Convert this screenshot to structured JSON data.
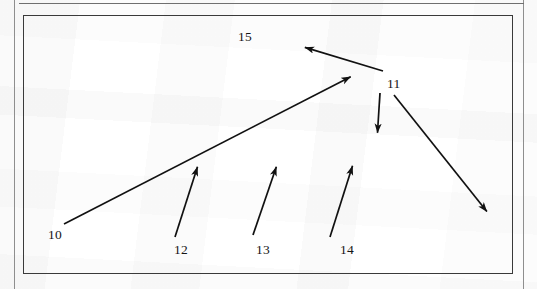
{
  "document": {
    "type": "patent-figure",
    "page_frame": {
      "left_rule_color": "#8e8e8e",
      "right_rule_color": "#8e8e8e",
      "top_rule_color": "#6f6f6f"
    },
    "figure_box": {
      "border_color": "#3a3a3a",
      "background": "#fafafa"
    }
  },
  "figure": {
    "line_color": "#111111",
    "reference_numerals": [
      {
        "id": "10",
        "label": "10",
        "x": 48,
        "y": 228
      },
      {
        "id": "15",
        "label": "15",
        "x": 238,
        "y": 30
      },
      {
        "id": "11",
        "label": "11",
        "x": 387,
        "y": 77
      },
      {
        "id": "12",
        "label": "12",
        "x": 174,
        "y": 243
      },
      {
        "id": "13",
        "label": "13",
        "x": 256,
        "y": 243
      },
      {
        "id": "14",
        "label": "14",
        "x": 340,
        "y": 243
      }
    ],
    "leader_arrows": [
      {
        "id": "arrow-10",
        "for_numeral": "10",
        "from": [
          64,
          224
        ],
        "to": [
          358,
          73
        ],
        "description": "long diagonal leader rising to upper-right vertex"
      },
      {
        "id": "arrow-15",
        "for_numeral": "15",
        "from": [
          383,
          71
        ],
        "to": [
          297,
          45
        ],
        "description": "leader from vertex pointing up-left toward numeral 15"
      },
      {
        "id": "arrow-11-down",
        "for_numeral": "11",
        "from": [
          380,
          93
        ],
        "to": [
          377,
          141
        ],
        "description": "near-vertical leader descending from numeral 11"
      },
      {
        "id": "arrow-11-downright",
        "for_numeral": "11",
        "from": [
          394,
          95
        ],
        "to": [
          492,
          218
        ],
        "description": "leader descending to the right from numeral 11"
      },
      {
        "id": "arrow-12",
        "for_numeral": "12",
        "from": [
          175,
          237
        ],
        "to": [
          200,
          159
        ],
        "description": "short leader rising to upper-right"
      },
      {
        "id": "arrow-13",
        "for_numeral": "13",
        "from": [
          253,
          235
        ],
        "to": [
          279,
          159
        ],
        "description": "short leader rising to upper-right"
      },
      {
        "id": "arrow-14",
        "for_numeral": "14",
        "from": [
          330,
          237
        ],
        "to": [
          355,
          158
        ],
        "description": "short leader rising to upper-right"
      }
    ]
  }
}
